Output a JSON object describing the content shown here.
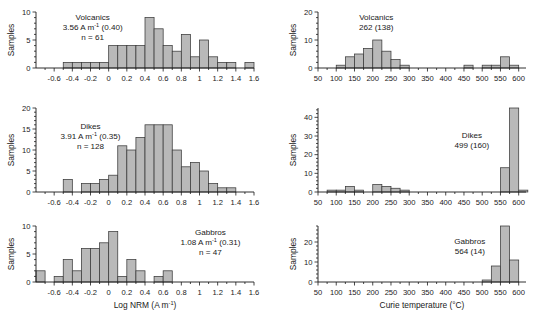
{
  "figure": {
    "bar_color": "#b9b9b9",
    "bar_edge_color": "#3a3a3a",
    "axis_color": "#1a1a1a",
    "background": "#ffffff"
  },
  "axis_titles": {
    "left_x": "Log NRM (A m",
    "left_x_sup": "-1",
    "left_x_tail": ")",
    "right_x": "Curie temperature (°C)",
    "y": "Samples"
  },
  "chart_data": [
    {
      "id": "volcanics-nrm",
      "type": "bar",
      "title": "Volcanics",
      "annotation_lines": [
        "Volcanics",
        "3.56 A m⁻¹ (0.40)",
        "n = 61"
      ],
      "mean_label": "3.56",
      "mean_units": "A m",
      "mean_units_sup": "-1",
      "std_label": "(0.40)",
      "n_label": "n = 61",
      "xlabel": "Log NRM (A m-1)",
      "ylabel": "Samples",
      "xlim": [
        -0.8,
        1.6
      ],
      "ylim": [
        0,
        10
      ],
      "yticks": [
        0,
        5,
        10
      ],
      "yticklabels": [
        "0",
        "5",
        "10"
      ],
      "yminor_step": 1,
      "xticks": [
        -0.6,
        -0.4,
        -0.2,
        0,
        0.2,
        0.4,
        0.6,
        0.8,
        1.0,
        1.2,
        1.4,
        1.6
      ],
      "xticklabels": [
        "-0.6",
        "-0.4",
        "-0.2",
        "0",
        "0.2",
        "0.4",
        "0.6",
        "0.8",
        "1",
        "1.2",
        "1.4",
        "1.6"
      ],
      "bin_width": 0.1,
      "bin_starts": [
        -0.8,
        -0.7,
        -0.6,
        -0.5,
        -0.4,
        -0.3,
        -0.2,
        -0.1,
        0.0,
        0.1,
        0.2,
        0.3,
        0.4,
        0.5,
        0.6,
        0.7,
        0.8,
        0.9,
        1.0,
        1.1,
        1.2,
        1.3,
        1.4,
        1.5
      ],
      "values": [
        0,
        0,
        0,
        1,
        1,
        1,
        1,
        1,
        4,
        4,
        4,
        4,
        9,
        7,
        4,
        3,
        6,
        2,
        5,
        2,
        1,
        1,
        0,
        1
      ],
      "grid": false
    },
    {
      "id": "volcanics-curie",
      "type": "bar",
      "title": "Volcanics",
      "annotation_lines": [
        "Volcanics",
        "262 (138)"
      ],
      "mean_label": "262",
      "std_label": "(138)",
      "xlabel": "Curie temperature (°C)",
      "ylabel": "Samples",
      "xlim": [
        50,
        620
      ],
      "ylim": [
        0,
        20
      ],
      "yticks": [
        0,
        10,
        20
      ],
      "yticklabels": [
        "0",
        "10",
        "20"
      ],
      "yminor_step": 2,
      "xticks": [
        50,
        100,
        150,
        200,
        250,
        300,
        350,
        400,
        450,
        500,
        550,
        600
      ],
      "xticklabels": [
        "50",
        "100",
        "150",
        "200",
        "250",
        "300",
        "350",
        "400",
        "450",
        "500",
        "550",
        "600"
      ],
      "bin_width": 25,
      "bin_starts": [
        100,
        125,
        150,
        175,
        200,
        225,
        250,
        275,
        450,
        475,
        500,
        525,
        550,
        575
      ],
      "values": [
        1,
        4,
        5,
        7,
        10,
        6,
        3,
        1,
        1,
        0,
        1,
        1,
        4,
        1
      ],
      "grid": false
    },
    {
      "id": "dikes-nrm",
      "type": "bar",
      "title": "Dikes",
      "annotation_lines": [
        "Dikes",
        "3.91 A m⁻¹ (0.35)",
        "n = 128"
      ],
      "mean_label": "3.91",
      "mean_units": "A m",
      "mean_units_sup": "-1",
      "std_label": "(0.35)",
      "n_label": "n = 128",
      "xlabel": "Log NRM (A m-1)",
      "ylabel": "Samples",
      "xlim": [
        -0.8,
        1.6
      ],
      "ylim": [
        0,
        20
      ],
      "yticks": [
        0,
        5,
        10,
        15,
        20
      ],
      "yticklabels": [
        "0",
        "5",
        "10",
        "15",
        "20"
      ],
      "yminor_step": 1,
      "xticks": [
        -0.6,
        -0.4,
        -0.2,
        0,
        0.2,
        0.4,
        0.6,
        0.8,
        1.0,
        1.2,
        1.4,
        1.6
      ],
      "xticklabels": [
        "-0.6",
        "-0.4",
        "-0.2",
        "0",
        "0.2",
        "0.4",
        "0.6",
        "0.8",
        "1",
        "1.2",
        "1.4",
        "1.6"
      ],
      "bin_width": 0.1,
      "bin_starts": [
        -0.8,
        -0.7,
        -0.6,
        -0.5,
        -0.4,
        -0.3,
        -0.2,
        -0.1,
        0.0,
        0.1,
        0.2,
        0.3,
        0.4,
        0.5,
        0.6,
        0.7,
        0.8,
        0.9,
        1.0,
        1.1,
        1.2,
        1.3,
        1.4,
        1.5
      ],
      "values": [
        0,
        0,
        0,
        3,
        0,
        2,
        2,
        3,
        4,
        11,
        10,
        13,
        16,
        16,
        16,
        10,
        6,
        7,
        5,
        2,
        1,
        1,
        0,
        0
      ],
      "grid": false
    },
    {
      "id": "dikes-curie",
      "type": "bar",
      "title": "Dikes",
      "annotation_lines": [
        "Dikes",
        "499 (160)"
      ],
      "mean_label": "499",
      "std_label": "(160)",
      "xlabel": "Curie temperature (°C)",
      "ylabel": "Samples",
      "xlim": [
        50,
        620
      ],
      "ylim": [
        0,
        45
      ],
      "yticks": [
        0,
        10,
        20,
        30,
        40
      ],
      "yticklabels": [
        "0",
        "10",
        "20",
        "30",
        "40"
      ],
      "yminor_step": 2,
      "xticks": [
        50,
        100,
        150,
        200,
        250,
        300,
        350,
        400,
        450,
        500,
        550,
        600
      ],
      "xticklabels": [
        "50",
        "100",
        "150",
        "200",
        "250",
        "300",
        "350",
        "400",
        "450",
        "500",
        "550",
        "600"
      ],
      "bin_width": 25,
      "bin_starts": [
        75,
        100,
        125,
        150,
        175,
        200,
        225,
        250,
        275,
        550,
        575,
        600
      ],
      "values": [
        1,
        1,
        3,
        1,
        0,
        4,
        3,
        2,
        1,
        13,
        45,
        1
      ],
      "grid": false
    },
    {
      "id": "gabbros-nrm",
      "type": "bar",
      "title": "Gabbros",
      "annotation_lines": [
        "Gabbros",
        "1.08 A m⁻¹ (0.31)",
        "n = 47"
      ],
      "mean_label": "1.08",
      "mean_units": "A m",
      "mean_units_sup": "-1",
      "std_label": "(0.31)",
      "n_label": "n = 47",
      "xlabel": "Log NRM (A m-1)",
      "ylabel": "Samples",
      "xlim": [
        -0.8,
        1.6
      ],
      "ylim": [
        0,
        10
      ],
      "yticks": [
        0,
        5,
        10
      ],
      "yticklabels": [
        "0",
        "5",
        "10"
      ],
      "yminor_step": 1,
      "xticks": [
        -0.6,
        -0.4,
        -0.2,
        0,
        0.2,
        0.4,
        0.6,
        0.8,
        1.0,
        1.2,
        1.4,
        1.6
      ],
      "xticklabels": [
        "-0.6",
        "-0.4",
        "-0.2",
        "0",
        "0.2",
        "0.4",
        "0.6",
        "0.8",
        "1",
        "1.2",
        "1.4",
        "1.6"
      ],
      "bin_width": 0.1,
      "bin_starts": [
        -0.8,
        -0.7,
        -0.6,
        -0.5,
        -0.4,
        -0.3,
        -0.2,
        -0.1,
        0.0,
        0.1,
        0.2,
        0.3,
        0.4,
        0.5,
        0.6,
        0.7,
        0.8,
        0.9,
        1.0,
        1.1,
        1.2,
        1.3,
        1.4,
        1.5
      ],
      "values": [
        2,
        0,
        1,
        4,
        2,
        6,
        6,
        7,
        9,
        1,
        4,
        2,
        0,
        1,
        2,
        0,
        0,
        0,
        0,
        0,
        0,
        0,
        0,
        0
      ],
      "grid": false
    },
    {
      "id": "gabbros-curie",
      "type": "bar",
      "title": "Gabbros",
      "annotation_lines": [
        "Gabbros",
        "564 (14)"
      ],
      "mean_label": "564",
      "std_label": "(14)",
      "xlabel": "Curie temperature (°C)",
      "ylabel": "Samples",
      "xlim": [
        50,
        620
      ],
      "ylim": [
        0,
        28
      ],
      "yticks": [
        0,
        10,
        20
      ],
      "yticklabels": [
        "0",
        "10",
        "20"
      ],
      "yminor_step": 2,
      "xticks": [
        50,
        100,
        150,
        200,
        250,
        300,
        350,
        400,
        450,
        500,
        550,
        600
      ],
      "xticklabels": [
        "50",
        "100",
        "150",
        "200",
        "250",
        "300",
        "350",
        "400",
        "450",
        "500",
        "550",
        "600"
      ],
      "bin_width": 25,
      "bin_starts": [
        500,
        525,
        550,
        575
      ],
      "values": [
        1,
        8,
        28,
        11
      ],
      "grid": false
    }
  ]
}
